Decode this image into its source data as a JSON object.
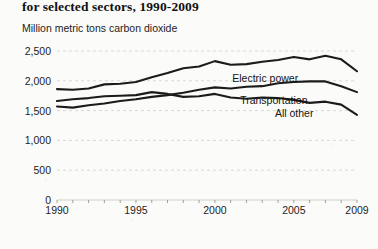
{
  "chart_data": {
    "type": "line",
    "title": "for selected sectors, 1990-2009",
    "subtitle": "Million metric tons carbon dioxide",
    "ylabel": "Million metric tons carbon dioxide",
    "xlabel": "",
    "ylim": [
      0,
      2500
    ],
    "xlim": [
      1990,
      2009
    ],
    "yticks": [
      "0",
      "500",
      "1,000",
      "1,500",
      "2,000",
      "2,500"
    ],
    "ytick_values": [
      0,
      500,
      1000,
      1500,
      2000,
      2500
    ],
    "xticks": [
      "1990",
      "1995",
      "2000",
      "2005",
      "2009"
    ],
    "xtick_values": [
      1990,
      1995,
      2000,
      2005,
      2009
    ],
    "grid": true,
    "legend_position": "inline-labels",
    "x": [
      1990,
      1991,
      1992,
      1993,
      1994,
      1995,
      1996,
      1997,
      1998,
      1999,
      2000,
      2001,
      2002,
      2003,
      2004,
      2005,
      2006,
      2007,
      2008,
      2009
    ],
    "series": [
      {
        "name": "Electric power",
        "label": "Electric power",
        "values": [
          1860,
          1850,
          1870,
          1940,
          1950,
          1980,
          2060,
          2130,
          2210,
          2240,
          2330,
          2270,
          2280,
          2320,
          2350,
          2400,
          2360,
          2420,
          2360,
          2160
        ]
      },
      {
        "name": "Transportation",
        "label": "Transportation",
        "values": [
          1570,
          1550,
          1590,
          1620,
          1660,
          1690,
          1730,
          1760,
          1800,
          1850,
          1890,
          1870,
          1900,
          1910,
          1960,
          1980,
          1990,
          1990,
          1910,
          1810
        ]
      },
      {
        "name": "All other",
        "label": "All other",
        "values": [
          1660,
          1690,
          1710,
          1740,
          1750,
          1760,
          1810,
          1780,
          1730,
          1740,
          1780,
          1720,
          1700,
          1720,
          1710,
          1680,
          1630,
          1650,
          1600,
          1430
        ]
      }
    ]
  },
  "axis": {
    "y_tick_labels": [
      "2,500",
      "2,000",
      "1,500",
      "1,000",
      "500",
      "0"
    ],
    "x_tick_labels": [
      "1990",
      "1995",
      "2000",
      "2005",
      "2009"
    ]
  }
}
